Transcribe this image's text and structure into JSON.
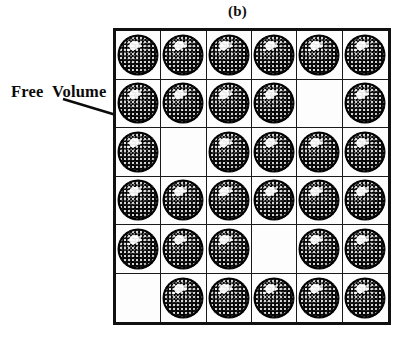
{
  "figure": {
    "caption": "(b)",
    "annotation_label": "Free  Volume"
  },
  "colors": {
    "background": "#ffffff",
    "grid_line": "#1a1a1a",
    "border": "#111111",
    "molecule_fill": "#050505",
    "text": "#0b0b0b"
  },
  "lattice": {
    "rows": 6,
    "columns": 6,
    "cell_state_legend": {
      "1": "occupied-site",
      "0": "free-volume-site"
    },
    "occupancy": [
      [
        1,
        1,
        1,
        1,
        1,
        1
      ],
      [
        1,
        1,
        1,
        1,
        0,
        1
      ],
      [
        1,
        0,
        1,
        1,
        1,
        1
      ],
      [
        1,
        1,
        1,
        1,
        1,
        1
      ],
      [
        1,
        1,
        1,
        0,
        1,
        1
      ],
      [
        0,
        1,
        1,
        1,
        1,
        1
      ]
    ],
    "occupied_count": 32,
    "free_count": 4
  },
  "arrow": {
    "name": "free-volume-pointer",
    "start_x": 63,
    "start_y": 99,
    "end_x": 189,
    "end_y": 137
  }
}
